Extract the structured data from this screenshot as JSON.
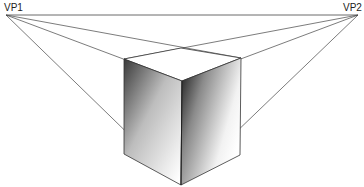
{
  "diagram": {
    "vanishing_points": [
      {
        "label": "VP1",
        "x": 6,
        "y": 15
      },
      {
        "label": "VP2",
        "x": 358,
        "y": 15
      }
    ],
    "horizon_line": {
      "y": 15
    },
    "cube": {
      "top_back": {
        "x": 181,
        "y": 48
      },
      "top_left": {
        "x": 124,
        "y": 59
      },
      "top_right": {
        "x": 241,
        "y": 58
      },
      "top_front": {
        "x": 182,
        "y": 81
      },
      "bottom_left": {
        "x": 124,
        "y": 154
      },
      "bottom_right": {
        "x": 240,
        "y": 155
      },
      "bottom_front": {
        "x": 181,
        "y": 185
      }
    },
    "colors": {
      "line": "#333333",
      "shade_dark": "#1a1a1a",
      "shade_light": "#ffffff"
    }
  }
}
